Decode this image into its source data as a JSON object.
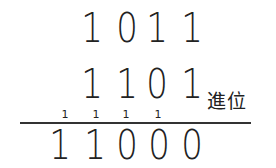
{
  "problem": {
    "addend1": [
      "1",
      "0",
      "1",
      "1"
    ],
    "addend2": [
      "1",
      "1",
      "0",
      "1"
    ],
    "carries": [
      "1",
      "1",
      "1",
      "1"
    ],
    "sum": [
      "1",
      "1",
      "0",
      "0",
      "0"
    ],
    "carry_label": "進位"
  },
  "colors": {
    "ink": "#222222",
    "background": "#ffffff"
  }
}
